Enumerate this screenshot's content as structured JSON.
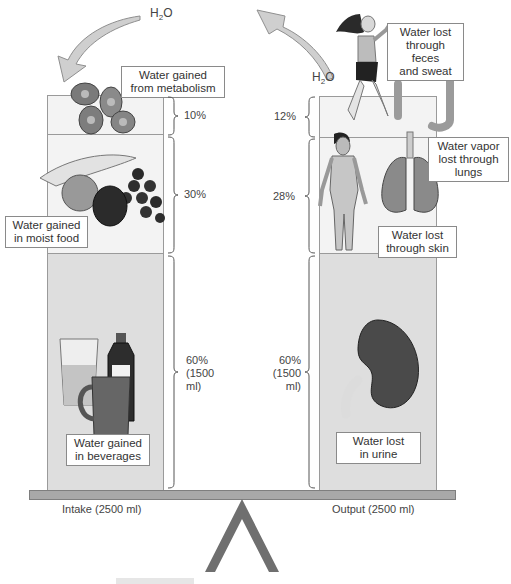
{
  "h2o_label_left": "H₂O",
  "h2o_label_right": "H₂O",
  "intake": {
    "caption": "Intake (2500 ml)",
    "segments": [
      {
        "label": "Water gained from metabolism",
        "line1": "Water gained",
        "line2": "from metabolism",
        "percent": "10%"
      },
      {
        "label": "Water gained in moist food",
        "line1": "Water gained",
        "line2": "in moist food",
        "percent": "30%"
      },
      {
        "label": "Water gained in beverages",
        "line1": "Water gained",
        "line2": "in beverages",
        "percent_line1": "60%",
        "percent_line2": "(1500",
        "percent_line3": "ml)"
      }
    ]
  },
  "output": {
    "caption": "Output (2500 ml)",
    "segments": [
      {
        "label": "Water lost through feces and sweat",
        "line1": "Water lost",
        "line2": "through feces",
        "line3": "and sweat",
        "percent": "12%"
      },
      {
        "label": "Water vapor lost through lungs",
        "line1": "Water vapor",
        "line2": "lost through",
        "line3": "lungs",
        "percent": "28%"
      },
      {
        "label": "Water lost through skin",
        "line1": "Water lost",
        "line2": "through skin"
      },
      {
        "label": "Water lost in urine",
        "line1": "Water lost",
        "line2": "in urine",
        "percent_line1": "60%",
        "percent_line2": "(1500",
        "percent_line3": "ml)"
      }
    ]
  },
  "colors": {
    "column_light": "#f3f3f3",
    "column_mid": "#dedede",
    "beam": "#a8a8a8",
    "fulcrum": "#6f6f6f",
    "arrow": "#c8c8c8"
  }
}
